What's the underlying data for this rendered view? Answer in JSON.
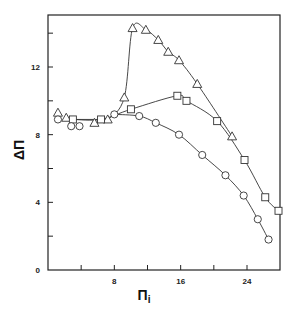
{
  "chart_data": {
    "type": "line",
    "title": "",
    "xlabel": "Πi",
    "ylabel": "ΔΠ",
    "xlim": [
      0,
      28
    ],
    "ylim": [
      0,
      15
    ],
    "xticks": [
      0,
      4,
      8,
      12,
      16,
      20,
      24
    ],
    "xtick_labels": [
      "",
      "",
      "8",
      "",
      "16",
      "",
      "24"
    ],
    "yticks": [
      0,
      2,
      4,
      6,
      8,
      10,
      12,
      14
    ],
    "ytick_labels": [
      "0",
      "",
      "4",
      "",
      "8",
      "",
      "12",
      ""
    ],
    "grid": false,
    "legend": "none",
    "series": [
      {
        "name": "triangles",
        "marker": "triangle",
        "x": [
          1.2,
          2.2,
          5.6,
          7.2,
          9.2,
          10.2,
          11.8,
          13.3,
          14.5,
          15.8,
          18.0,
          22.2
        ],
        "y": [
          9.3,
          9.0,
          8.7,
          8.9,
          10.2,
          14.3,
          14.2,
          13.6,
          12.9,
          12.4,
          11.0,
          7.9
        ]
      },
      {
        "name": "squares",
        "marker": "square",
        "x": [
          3.0,
          6.4,
          10.0,
          15.6,
          16.7,
          20.4,
          23.7,
          26.2,
          27.8
        ],
        "y": [
          8.9,
          8.9,
          9.5,
          10.3,
          10.0,
          8.8,
          6.5,
          4.3,
          3.5
        ]
      },
      {
        "name": "circles",
        "marker": "circle",
        "x": [
          1.2,
          2.8,
          3.8,
          8.0,
          11.0,
          13.0,
          15.8,
          18.6,
          21.4,
          23.6,
          25.3,
          26.6
        ],
        "y": [
          8.9,
          8.5,
          8.5,
          9.2,
          9.1,
          8.7,
          8.0,
          6.8,
          5.6,
          4.4,
          3.0,
          1.8
        ]
      }
    ]
  },
  "axes": {
    "x_title": "Π",
    "x_subscript": "i",
    "y_title": "ΔΠ"
  }
}
